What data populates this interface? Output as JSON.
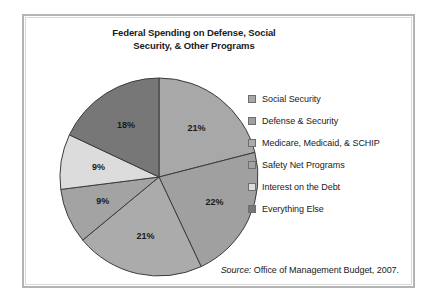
{
  "figure": {
    "title": "Federal Spending on Defense, Social Security, & Other Programs",
    "title_line1": "Federal Spending on Defense, Social",
    "title_line2": "Security, & Other Programs",
    "source_prefix": "Source:",
    "source_text": " Office of Management Budget, 2007."
  },
  "chart_data": {
    "type": "pie",
    "title": "Federal Spending on Defense, Social Security, & Other Programs",
    "categories": [
      "Social Security",
      "Defense & Security",
      "Medicare, Medicaid, & SCHIP",
      "Safety Net Programs",
      "Interest on the Debt",
      "Everything Else"
    ],
    "values": [
      21,
      22,
      21,
      9,
      9,
      18
    ],
    "value_labels": [
      "21%",
      "22%",
      "21%",
      "9%",
      "9%",
      "18%"
    ],
    "colors": [
      "#a8a8a8",
      "#a0a0a0",
      "#ababab",
      "#a3a3a3",
      "#dcdcdc",
      "#777777"
    ],
    "start_angle_deg": 0,
    "direction": "clockwise",
    "legend_position": "right",
    "grid": false,
    "source": "Source: Office of Management Budget, 2007."
  },
  "legend": {
    "items": [
      {
        "label": "Social Security",
        "color": "#a8a8a8"
      },
      {
        "label": "Defense & Security",
        "color": "#a0a0a0"
      },
      {
        "label": "Medicare, Medicaid, & SCHIP",
        "color": "#ababab"
      },
      {
        "label": "Safety Net Programs",
        "color": "#a3a3a3"
      },
      {
        "label": "Interest on the Debt",
        "color": "#dcdcdc"
      },
      {
        "label": "Everything Else",
        "color": "#777777"
      }
    ]
  }
}
